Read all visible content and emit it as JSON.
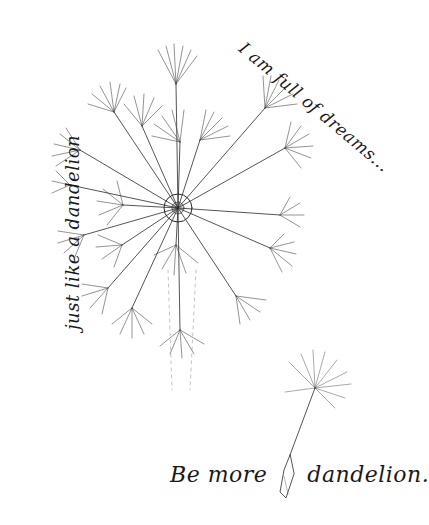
{
  "illustration": {
    "subject": "dandelion seed head with one floating seed",
    "style": "pencil line drawing",
    "ink_color": "#1a1a1a",
    "background_color": "#ffffff"
  },
  "texts": {
    "top_arc": "I am full of dreams...",
    "side_vertical": "just like a dandelion",
    "bottom_line_part1": "Be more",
    "bottom_line_part2": "dandelion."
  }
}
